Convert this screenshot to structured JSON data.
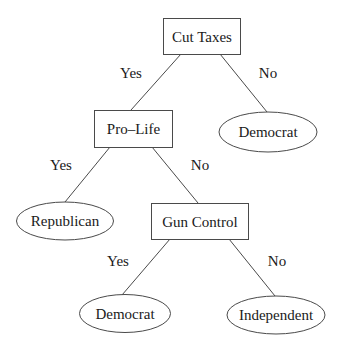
{
  "diagram": {
    "type": "decision-tree",
    "colors": {
      "line": "#4a4a4a",
      "text": "#1a1a1a",
      "background": "#ffffff"
    },
    "nodes": {
      "cut_taxes": {
        "label": "Cut Taxes",
        "shape": "rect",
        "kind": "decision"
      },
      "pro_life": {
        "label": "Pro–Life",
        "shape": "rect",
        "kind": "decision"
      },
      "democrat_1": {
        "label": "Democrat",
        "shape": "ellipse",
        "kind": "leaf"
      },
      "republican": {
        "label": "Republican",
        "shape": "ellipse",
        "kind": "leaf"
      },
      "gun_control": {
        "label": "Gun Control",
        "shape": "rect",
        "kind": "decision"
      },
      "democrat_2": {
        "label": "Democrat",
        "shape": "ellipse",
        "kind": "leaf"
      },
      "independent": {
        "label": "Independent",
        "shape": "ellipse",
        "kind": "leaf"
      }
    },
    "edges": {
      "cut_taxes_yes": {
        "from": "cut_taxes",
        "to": "pro_life",
        "label": "Yes"
      },
      "cut_taxes_no": {
        "from": "cut_taxes",
        "to": "democrat_1",
        "label": "No"
      },
      "pro_life_yes": {
        "from": "pro_life",
        "to": "republican",
        "label": "Yes"
      },
      "pro_life_no": {
        "from": "pro_life",
        "to": "gun_control",
        "label": "No"
      },
      "gun_control_yes": {
        "from": "gun_control",
        "to": "democrat_2",
        "label": "Yes"
      },
      "gun_control_no": {
        "from": "gun_control",
        "to": "independent",
        "label": "No"
      }
    }
  }
}
